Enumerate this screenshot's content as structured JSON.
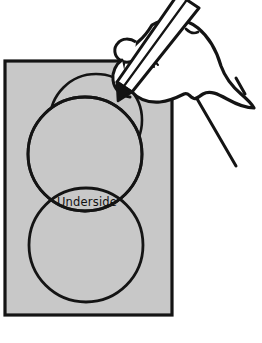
{
  "figure": {
    "type": "line-art-instructional-diagram"
  },
  "labels": {
    "underside": "Underside"
  },
  "colors": {
    "sheet_fill": "#c8c8c8",
    "sheet_stroke": "#141414",
    "line": "#141414",
    "skin_fill": "#ffffff",
    "pencil_fill": "#ffffff",
    "background": "#ffffff",
    "text": "#111111"
  },
  "sheet": {
    "name": "gray-rectangular-sheet",
    "x": 5,
    "y": 61,
    "width": 167,
    "height": 254,
    "stroke_width": 3.2
  },
  "circles": [
    {
      "name": "top-circle",
      "cx": 96,
      "cy": 120,
      "r": 46,
      "stroke_width": 2.6
    },
    {
      "name": "middle-circle",
      "cx": 85,
      "cy": 154,
      "r": 57,
      "stroke_width": 2.8
    },
    {
      "name": "bottom-circle",
      "cx": 86,
      "cy": 245,
      "r": 57,
      "stroke_width": 2.8
    }
  ],
  "overlap_region": {
    "name": "underside-lens-overlap",
    "label": "Underside",
    "label_x": 87,
    "label_y": 206
  },
  "hand": {
    "name": "hand-holding-pencil",
    "thumbnail": {
      "cx": 152,
      "cy": 52,
      "rx": 5.5,
      "ry": 7
    },
    "crease_count": 3
  },
  "pencil": {
    "name": "pencil",
    "tip_x": 118,
    "tip_y": 101,
    "angle_deg": 52
  }
}
